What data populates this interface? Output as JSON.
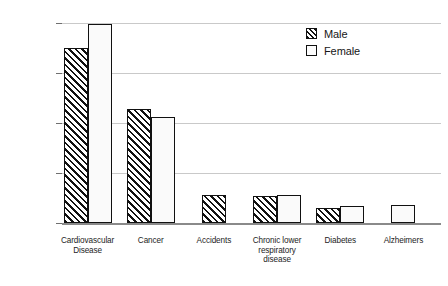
{
  "chart_data": {
    "type": "bar",
    "title": "",
    "subtitle": "",
    "xlabel": "",
    "ylabel": "",
    "ylim": [
      0,
      500000
    ],
    "yticks": [
      0,
      125000,
      250000,
      375000,
      500000
    ],
    "ytick_labels": [
      "0",
      "125,000",
      "250,000",
      "375,000",
      "500,000"
    ],
    "grid": true,
    "grid_axis": "y",
    "legend_position": "top-right",
    "categories": [
      "Cardiovascular Disease",
      "Cancer",
      "Accidents",
      "Chronic lower respiratory disease",
      "Diabetes",
      "Alzheimers"
    ],
    "category_lines": [
      [
        "Cardiovascular",
        "Disease"
      ],
      [
        "Cancer"
      ],
      [
        "Accidents"
      ],
      [
        "Chronic lower",
        "respiratory",
        "disease"
      ],
      [
        "Diabetes"
      ],
      [
        "Alzheimers"
      ]
    ],
    "series": [
      {
        "name": "Male",
        "pattern": "diagonal-hatch",
        "values": [
          437000,
          285000,
          70000,
          67000,
          38000,
          null
        ]
      },
      {
        "name": "Female",
        "pattern": "dotted",
        "values": [
          497000,
          265000,
          null,
          70000,
          42000,
          45000
        ]
      }
    ]
  },
  "legend": {
    "items": [
      {
        "label": "Male",
        "pattern": "diagonal-hatch"
      },
      {
        "label": "Female",
        "pattern": "dotted"
      }
    ]
  },
  "colors": {
    "background": "#ffffff",
    "gridline": "#c9c9c9",
    "axis": "#8a8a8a",
    "bar_outline": "#111111",
    "text": "#161616"
  }
}
